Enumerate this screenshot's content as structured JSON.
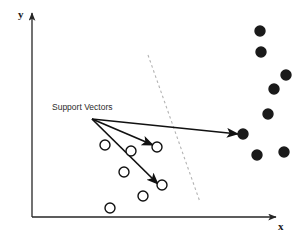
{
  "figure": {
    "background_color": "#ffffff",
    "width": 305,
    "height": 244
  },
  "axes": {
    "x_label": "x",
    "y_label": "y",
    "color": "#262626",
    "origin": {
      "x": 32,
      "y": 217
    },
    "x_axis_end": {
      "x": 276,
      "y": 217
    },
    "y_axis_end": {
      "x": 32,
      "y": 13
    }
  },
  "annotation": {
    "label": "Support Vectors",
    "label_x": 52,
    "label_y": 110,
    "arrow_color": "#111111",
    "arrow_origin": {
      "x": 92,
      "y": 119
    },
    "arrow_targets": [
      {
        "name": "support-vector-arrow-1",
        "x": 153,
        "y": 145
      },
      {
        "name": "support-vector-arrow-2",
        "x": 158,
        "y": 184
      },
      {
        "name": "support-vector-arrow-3",
        "x": 238,
        "y": 134
      }
    ]
  },
  "decision_boundary": {
    "style": "dashed",
    "color": "#b3b3b3",
    "x1": 148,
    "y1": 55,
    "x2": 200,
    "y2": 202
  },
  "chart_data": {
    "type": "scatter",
    "title": "Support Vectors",
    "xlabel": "x",
    "ylabel": "y",
    "grid": false,
    "legend": null,
    "annotations": [
      {
        "text": "Support Vectors",
        "x": 52,
        "y": 110
      }
    ],
    "series": [
      {
        "name": "class-open",
        "marker": "open-circle",
        "fill": "#ffffff",
        "stroke": "#111111",
        "radius": 5,
        "points": [
          {
            "x": 105,
            "y": 145
          },
          {
            "x": 131,
            "y": 151
          },
          {
            "x": 157,
            "y": 147
          },
          {
            "x": 124,
            "y": 172
          },
          {
            "x": 162,
            "y": 185
          },
          {
            "x": 143,
            "y": 196
          },
          {
            "x": 110,
            "y": 208
          }
        ]
      },
      {
        "name": "class-filled",
        "marker": "filled-circle",
        "fill": "#1a1a1a",
        "stroke": "#1a1a1a",
        "radius": 5,
        "points": [
          {
            "x": 260,
            "y": 31
          },
          {
            "x": 261,
            "y": 52
          },
          {
            "x": 286,
            "y": 75
          },
          {
            "x": 274,
            "y": 89
          },
          {
            "x": 268,
            "y": 114
          },
          {
            "x": 243,
            "y": 134
          },
          {
            "x": 257,
            "y": 155
          },
          {
            "x": 284,
            "y": 152
          }
        ]
      }
    ]
  }
}
